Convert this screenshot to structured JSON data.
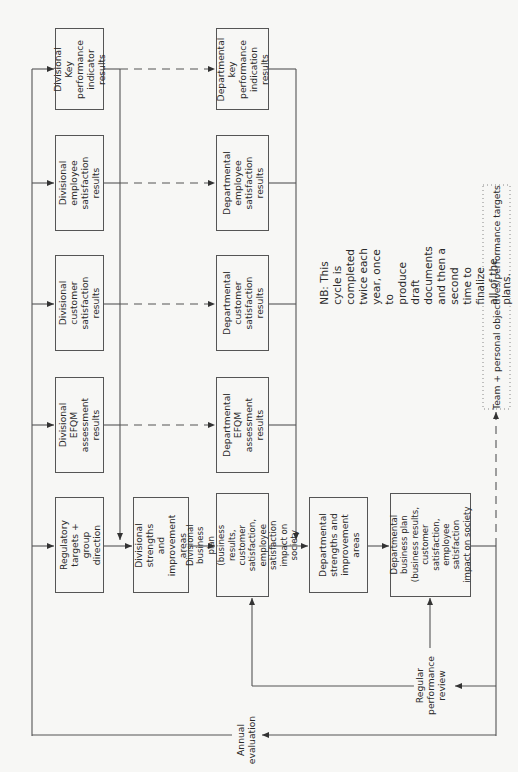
{
  "diagram": {
    "top_row": [
      {
        "id": "div-kpi",
        "label": "Divisional Key\nperformance\nindicator results"
      },
      {
        "id": "div-employee",
        "label": "Divisional employee\nsatisfaction\nresults"
      },
      {
        "id": "div-customer",
        "label": "Divisional customer\nsatisfaction\nresults"
      },
      {
        "id": "div-efqm",
        "label": "Divisional EFQM\nassessment\nresults"
      },
      {
        "id": "regulatory",
        "label": "Regulatory\ntargets + group\ndirection"
      }
    ],
    "div_strengths": {
      "label": "Divisional\nstrengths and\nimprovement\nareas"
    },
    "dept_row": [
      {
        "id": "dept-kpi",
        "label": "Departmental\nkey performance\nindication\nresults"
      },
      {
        "id": "dept-employee",
        "label": "Departmental\nemployee\nsatisfaction\nresults"
      },
      {
        "id": "dept-customer",
        "label": "Departmental\ncustomer\nsatisfaction\nresults"
      },
      {
        "id": "dept-efqm",
        "label": "Departmental\nEFQM\nassessment\nresults"
      },
      {
        "id": "div-business-plan",
        "label": "Divisional business\nplan (business results,\ncustomer satisfaction,\nemployee satisfaction\nimpact on society"
      }
    ],
    "dept_strengths": {
      "label": "Departmental\nstrengths and\nimprovement\nareas"
    },
    "dept_business_plan": {
      "label": "Departmental\nbusiness plan\n(business results,\ncustomer satisfaction,\nemployee satisfaction\nimpact on society"
    },
    "regular_review": {
      "label": "Regular\nperformance\nreview"
    },
    "annual_evaluation": {
      "label": "Annual\nevaluation"
    },
    "note": {
      "label": "NB: This cycle is completed twice each year, once to\nproduce draft documents and then a second time to finalize\nall of the plans."
    },
    "targets": {
      "label": "Team + personal objectives/performance targets"
    },
    "colors": {
      "line": "#555555",
      "background": "#f7f7f5",
      "text": "#2a2a2a"
    }
  }
}
